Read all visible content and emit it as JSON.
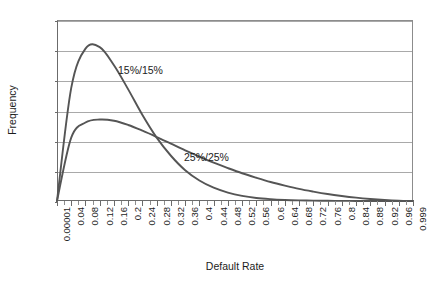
{
  "chart_data": {
    "type": "line",
    "title": "",
    "xlabel": "Default Rate",
    "ylabel": "Frequency",
    "ylim": [
      0,
      6
    ],
    "yticks": [
      0,
      1,
      2,
      3,
      4,
      5,
      6
    ],
    "grid": true,
    "legend_position": "inline-annotation",
    "categories": [
      "0.00001",
      "0.04",
      "0.08",
      "0.12",
      "0.16",
      "0.2",
      "0.24",
      "0.28",
      "0.32",
      "0.36",
      "0.4",
      "0.44",
      "0.48",
      "0.52",
      "0.56",
      "0.6",
      "0.64",
      "0.68",
      "0.72",
      "0.76",
      "0.8",
      "0.84",
      "0.88",
      "0.92",
      "0.96",
      "0.999"
    ],
    "x": [
      1e-05,
      0.04,
      0.08,
      0.12,
      0.16,
      0.2,
      0.24,
      0.28,
      0.32,
      0.36,
      0.4,
      0.44,
      0.48,
      0.52,
      0.56,
      0.6,
      0.64,
      0.68,
      0.72,
      0.76,
      0.8,
      0.84,
      0.88,
      0.92,
      0.96,
      0.999
    ],
    "series": [
      {
        "name": "15%/15%",
        "color": "#555555",
        "values": [
          0.0,
          3.75,
          5.05,
          5.1,
          4.5,
          3.7,
          2.85,
          2.1,
          1.5,
          1.02,
          0.68,
          0.44,
          0.28,
          0.17,
          0.1,
          0.06,
          0.035,
          0.02,
          0.012,
          0.007,
          0.004,
          0.002,
          0.001,
          0.0006,
          0.0003,
          0.0
        ]
      },
      {
        "name": "25%/25%",
        "color": "#555555",
        "values": [
          0.0,
          2.1,
          2.6,
          2.7,
          2.66,
          2.52,
          2.33,
          2.12,
          1.9,
          1.68,
          1.47,
          1.27,
          1.09,
          0.92,
          0.77,
          0.63,
          0.51,
          0.4,
          0.31,
          0.23,
          0.165,
          0.11,
          0.068,
          0.036,
          0.013,
          0.0
        ]
      }
    ],
    "annotations": [
      {
        "text": "15%/15%",
        "x_px": 118,
        "y_px": 64
      },
      {
        "text": "25%/25%",
        "x_px": 184,
        "y_px": 151
      }
    ]
  },
  "axes": {
    "y_title": "Frequency",
    "x_title": "Default Rate"
  }
}
